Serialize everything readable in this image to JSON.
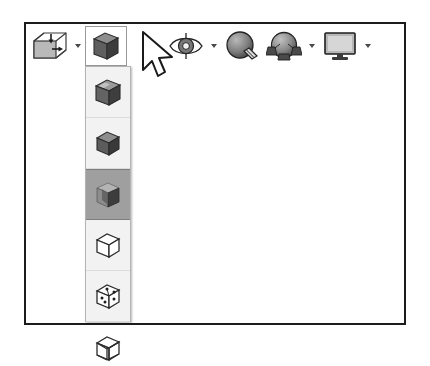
{
  "window": {
    "title": "3D Viewport Toolbar",
    "background_color": "#ffffff",
    "frame_color": "#1c1c1c"
  },
  "toolbar": {
    "name": "viewport-shading-toolbar",
    "buttons": [
      {
        "id": "object-bounds",
        "icon": "cube-with-arrows-icon",
        "label": "Object Bounds / Transform Gizmo",
        "has_caret": true,
        "pressed": false,
        "framed": false
      },
      {
        "id": "shading-mode",
        "icon": "shaded-cube-icon",
        "label": "Shading Mode",
        "has_caret": false,
        "pressed": true,
        "framed": true
      },
      {
        "id": "visibility",
        "icon": "eye-icon",
        "label": "Visibility / Show",
        "has_caret": true,
        "pressed": false,
        "framed": false
      },
      {
        "id": "material-paint",
        "icon": "sphere-with-brush-icon",
        "label": "Material / Texture Display",
        "has_caret": false,
        "pressed": false,
        "framed": false
      },
      {
        "id": "lighting",
        "icon": "sphere-with-lights-icon",
        "label": "Lighting and Shadows",
        "has_caret": true,
        "pressed": false,
        "framed": false
      },
      {
        "id": "display-monitor",
        "icon": "monitor-icon",
        "label": "Viewport Display Settings",
        "has_caret": true,
        "pressed": false,
        "framed": false
      }
    ]
  },
  "flyout": {
    "name": "shading-mode-flyout",
    "anchor_button": "shading-mode",
    "open": true,
    "selected_index": 2,
    "selected_background": "#9f9f9f",
    "panel_background": "#f2f2f2",
    "items": [
      {
        "id": "smooth-highlights",
        "icon": "shaded-cube-highlights-icon",
        "label": "Smooth + Highlights",
        "selected": false
      },
      {
        "id": "smooth",
        "icon": "shaded-cube-icon",
        "label": "Smooth",
        "selected": false
      },
      {
        "id": "facets",
        "icon": "faceted-cube-icon",
        "label": "Facets",
        "selected": true
      },
      {
        "id": "flat",
        "icon": "outline-cube-icon",
        "label": "Flat",
        "selected": false
      },
      {
        "id": "hidden-line",
        "icon": "dotted-vertex-cube-icon",
        "label": "Hidden Line",
        "selected": false
      },
      {
        "id": "wireframe",
        "icon": "wireframe-cube-icon",
        "label": "Wireframe",
        "selected": false
      }
    ]
  },
  "cursor": {
    "name": "mouse-pointer",
    "x": 140,
    "y": 30,
    "type": "arrow"
  }
}
